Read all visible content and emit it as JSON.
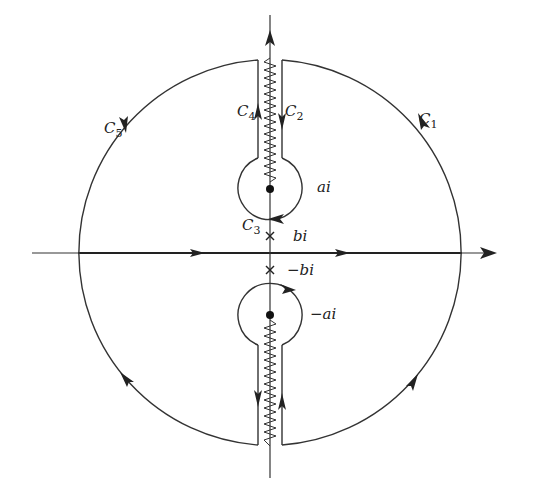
{
  "figure": {
    "type": "contour-integration-diagram",
    "colors": {
      "stroke": "#333333",
      "background": "#ffffff"
    }
  },
  "labels": {
    "c1": {
      "main": "C",
      "sub": "1"
    },
    "c2": {
      "main": "C",
      "sub": "2"
    },
    "c3": {
      "main": "C",
      "sub": "3"
    },
    "c4": {
      "main": "C",
      "sub": "4"
    },
    "c5": {
      "main": "C",
      "sub": "5"
    },
    "ai": "ai",
    "neg_ai": "−ai",
    "bi": "bi",
    "neg_bi": "−bi"
  },
  "points": {
    "branch_points": [
      "ai",
      "−ai"
    ],
    "poles": [
      "bi",
      "−bi"
    ]
  }
}
